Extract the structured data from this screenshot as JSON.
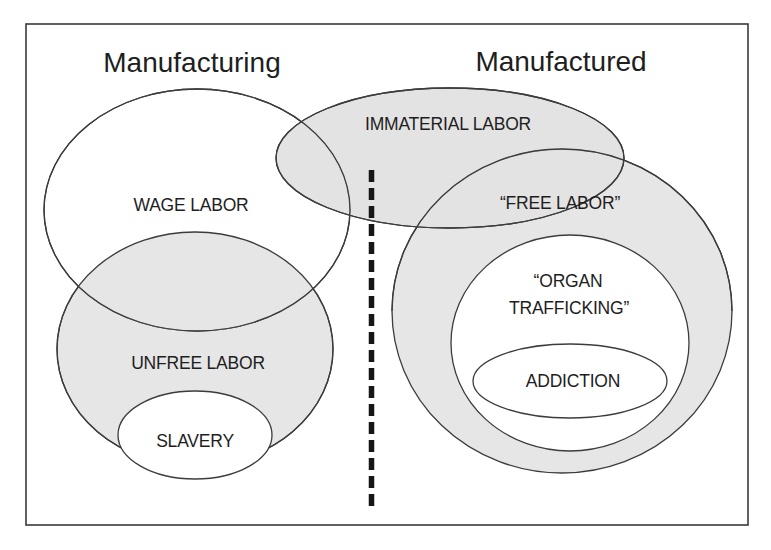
{
  "diagram": {
    "columns": {
      "left_title": "Manufacturing",
      "right_title": "Manufactured"
    },
    "sets": {
      "wage_labor": {
        "label": "WAGE LABOR",
        "fill": "#ffffff"
      },
      "unfree_labor": {
        "label": "UNFREE LABOR",
        "fill": "#e6e6e6"
      },
      "slavery": {
        "label": "SLAVERY",
        "fill": "#ffffff"
      },
      "immaterial_labor": {
        "label": "IMMATERIAL LABOR",
        "fill": "#e3e3e3"
      },
      "free_labor": {
        "label": "“FREE LABOR”",
        "fill": "#e6e6e6"
      },
      "organ_trafficking": {
        "label_line1": "“ORGAN",
        "label_line2": "TRAFFICKING”",
        "fill": "#ffffff"
      },
      "addiction": {
        "label": "ADDICTION",
        "fill": "#ffffff"
      }
    },
    "divider": {
      "style": "dashed",
      "color": "#161616"
    },
    "colors": {
      "outline": "#3c3c3c",
      "shaded": "#e6e6e6",
      "background": "#ffffff"
    }
  }
}
